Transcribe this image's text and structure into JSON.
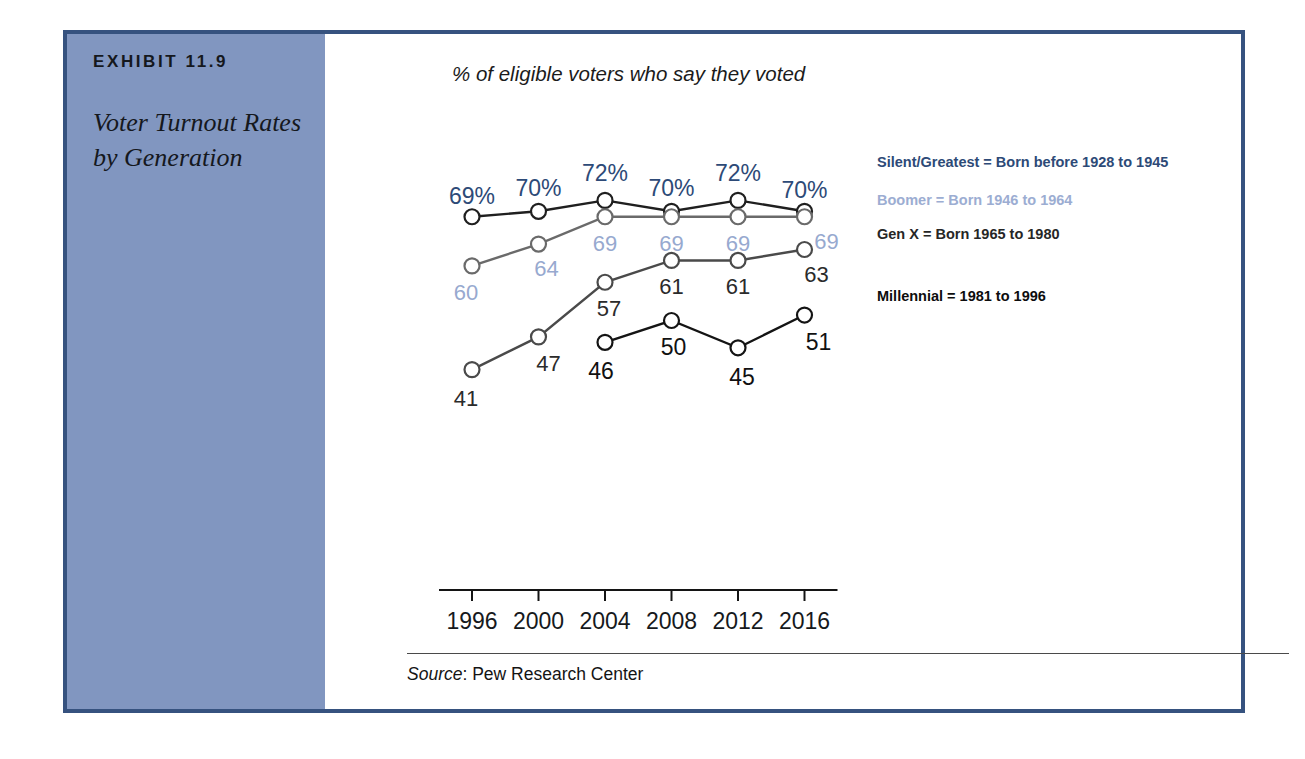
{
  "exhibit": {
    "number": "EXHIBIT 11.9",
    "title": "Voter Turnout Rates by Generation"
  },
  "source": {
    "label": "Source",
    "separator": ": ",
    "value": "Pew Research Center"
  },
  "legend": [
    {
      "key": "silent",
      "label": "Silent/Greatest = Born before 1928 to 1945",
      "color": "#2d4a77"
    },
    {
      "key": "boomer",
      "label": "Boomer = Born 1946 to 1964",
      "color": "#9cadd2"
    },
    {
      "key": "genx",
      "label": "Gen X = Born 1965 to 1980",
      "color": "#262626"
    },
    {
      "key": "mill",
      "label": "Millennial = 1981 to 1996",
      "color": "#0d0d0d"
    }
  ],
  "chart_data": {
    "type": "line",
    "title": "Voter Turnout Rates by Generation",
    "subtitle": "% of eligible voters who say they voted",
    "xlabel": "",
    "ylabel": "",
    "x": [
      1996,
      2000,
      2004,
      2008,
      2012,
      2016
    ],
    "xtick_labels": [
      "1996",
      "2000",
      "2004",
      "2008",
      "2012",
      "2016"
    ],
    "ylim": [
      38,
      75
    ],
    "grid": false,
    "legend_position": "right",
    "source": "Pew Research Center",
    "series": [
      {
        "name": "Silent/Greatest",
        "key": "silent",
        "color": "#2d4a77",
        "line_color": "#1f1f1f",
        "values": [
          69,
          70,
          72,
          70,
          72,
          70
        ],
        "labels": [
          "69%",
          "70%",
          "72%",
          "70%",
          "72%",
          "70%"
        ]
      },
      {
        "name": "Boomer",
        "key": "boomer",
        "color": "#97a9cf",
        "line_color": "#6a6a6a",
        "values": [
          60,
          64,
          69,
          69,
          69,
          69
        ],
        "labels": [
          "60",
          "64",
          "69",
          "69",
          "69",
          "69"
        ]
      },
      {
        "name": "Gen X",
        "key": "genx",
        "color": "#2b2b2b",
        "line_color": "#4a4a4a",
        "values": [
          41,
          47,
          57,
          61,
          61,
          63
        ],
        "labels": [
          "41",
          "47",
          "57",
          "61",
          "61",
          "63"
        ]
      },
      {
        "name": "Millennial",
        "key": "mill",
        "color": "#111111",
        "line_color": "#141414",
        "values": [
          null,
          null,
          46,
          50,
          45,
          51
        ],
        "labels": [
          null,
          null,
          "46",
          "50",
          "45",
          "51"
        ]
      }
    ]
  }
}
